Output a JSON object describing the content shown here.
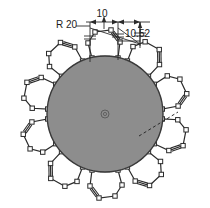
{
  "drawing": {
    "title": "cad-technical-drawing",
    "background_color": "#ffffff",
    "line_color": "#2b2b2b",
    "fill_color": "#8d8d8d",
    "canvas": {
      "width": 210,
      "height": 208
    }
  },
  "main_shape": {
    "name": "central-disc",
    "type": "circle",
    "cx": 105,
    "cy": 114,
    "r": 58,
    "fill": "#8d8d8d",
    "stroke": "#3a3a3a"
  },
  "center_mark": {
    "name": "center-marker",
    "cx": 105,
    "cy": 114,
    "r": 4
  },
  "dimensions": [
    {
      "id": "radius-dim",
      "label": "R 20",
      "x": 56,
      "y": 28,
      "anchor": "start"
    },
    {
      "id": "width-dim",
      "label": "10",
      "x": 102,
      "y": 17,
      "anchor": "middle"
    },
    {
      "id": "distance-dim",
      "label": "10.52",
      "x": 125,
      "y": 37,
      "anchor": "start"
    }
  ],
  "satellites": [
    {
      "id": "satellite-1",
      "angle": -108
    },
    {
      "id": "satellite-2",
      "angle": -72
    },
    {
      "id": "satellite-3",
      "angle": -36
    },
    {
      "id": "satellite-4",
      "angle": 0
    },
    {
      "id": "satellite-5",
      "angle": 36
    },
    {
      "id": "satellite-6",
      "angle": 72
    },
    {
      "id": "satellite-7",
      "angle": 108
    },
    {
      "id": "satellite-8",
      "angle": 144
    },
    {
      "id": "satellite-9",
      "angle": 180
    },
    {
      "id": "satellite-10",
      "angle": -144
    }
  ],
  "leader": {
    "name": "dashed-leader-line",
    "x1": 139,
    "y1": 136,
    "x2": 178,
    "y2": 112
  }
}
